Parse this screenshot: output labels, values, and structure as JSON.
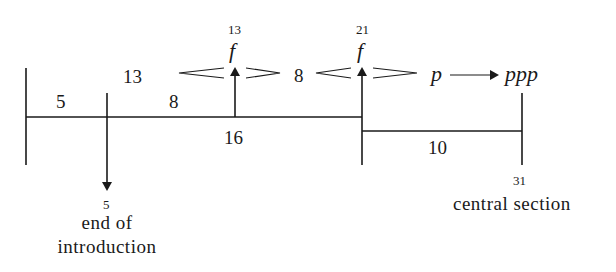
{
  "diagram": {
    "segments": {
      "intro_duration": "5",
      "intro_to_first_climax_upper": "13",
      "intro_to_first_climax_lower": "8",
      "first_to_second_climax": "8",
      "first_climax_position": "16",
      "build_to_central": "10"
    },
    "markers": {
      "first_climax": {
        "bar": "13",
        "dynamic": "f"
      },
      "second_climax": {
        "bar": "21",
        "dynamic": "f"
      },
      "intro_end": {
        "bar": "5",
        "label_line1": "end of",
        "label_line2": "introduction"
      },
      "central": {
        "bar": "31",
        "label": "central section"
      }
    },
    "dynamics_transition": {
      "from": "p",
      "to": "ppp"
    }
  }
}
